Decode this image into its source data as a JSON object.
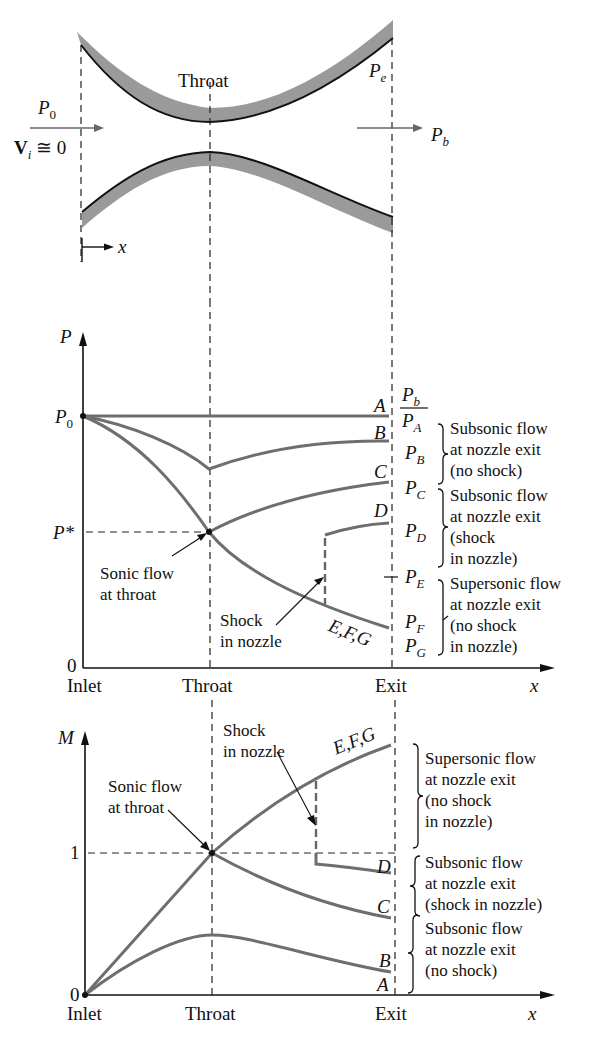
{
  "nozzle": {
    "throat_label": "Throat",
    "exit_pressure_label": "P",
    "exit_pressure_sub": "e",
    "inlet_pressure_label": "P",
    "inlet_pressure_sub": "0",
    "inlet_velocity_label": "V",
    "inlet_velocity_sub": "i",
    "inlet_velocity_value": "≅ 0",
    "back_pressure_label": "P",
    "back_pressure_sub": "b",
    "x_axis_label": "x",
    "colors": {
      "wall_fill": "#9a9a9a",
      "wall_edge": "#111111"
    }
  },
  "pressure_plot": {
    "y_axis_label": "P",
    "p0_label": "P",
    "p0_sub": "0",
    "pstar_label": "P*",
    "zero_label": "0",
    "x_ticks": [
      "Inlet",
      "Throat",
      "Exit"
    ],
    "x_axis_label": "x",
    "curve_labels": [
      "A",
      "B",
      "C",
      "D",
      "E,F,G"
    ],
    "annotation_sonic": [
      "Sonic flow",
      "at throat"
    ],
    "annotation_shock": [
      "Shock",
      "in nozzle"
    ],
    "pb_header": {
      "label": "P",
      "sub": "b"
    },
    "exit_pressures": [
      {
        "label": "P",
        "sub": "A"
      },
      {
        "label": "P",
        "sub": "B"
      },
      {
        "label": "P",
        "sub": "C"
      },
      {
        "label": "P",
        "sub": "D"
      },
      {
        "label": "P",
        "sub": "E"
      },
      {
        "label": "P",
        "sub": "F"
      },
      {
        "label": "P",
        "sub": "G"
      }
    ],
    "regimes": [
      [
        "Subsonic flow",
        "at nozzle exit",
        "(no shock)"
      ],
      [
        "Subsonic flow",
        "at nozzle exit",
        "(shock",
        "in nozzle)"
      ],
      [
        "Supersonic flow",
        "at nozzle exit",
        "(no shock",
        "in nozzle)"
      ]
    ]
  },
  "mach_plot": {
    "y_axis_label": "M",
    "one_label": "1",
    "zero_label": "0",
    "x_ticks": [
      "Inlet",
      "Throat",
      "Exit"
    ],
    "x_axis_label": "x",
    "curve_labels": [
      "E,F,G",
      "D",
      "C",
      "B",
      "A"
    ],
    "annotation_sonic": [
      "Sonic flow",
      "at throat"
    ],
    "annotation_shock": [
      "Shock",
      "in nozzle"
    ],
    "regimes": [
      [
        "Supersonic flow",
        "at nozzle exit",
        "(no shock",
        "in nozzle)"
      ],
      [
        "Subsonic flow",
        "at nozzle exit",
        "(shock in nozzle)"
      ],
      [
        "Subsonic flow",
        "at nozzle exit",
        "(no shock)"
      ]
    ]
  },
  "colors": {
    "curve": "#6e6e6e",
    "axis": "#111111",
    "dash": "#222222"
  }
}
